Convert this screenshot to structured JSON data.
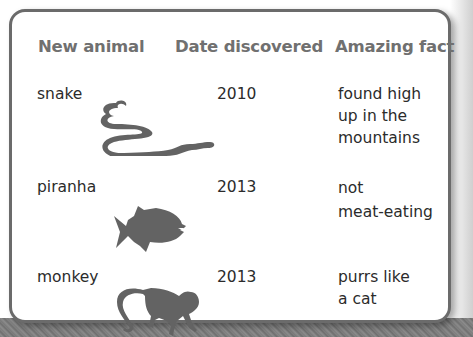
{
  "table": {
    "headers": {
      "animal": "New animal",
      "date": "Date discovered",
      "fact": "Amazing fact"
    },
    "rows": [
      {
        "animal": "snake",
        "icon": "snake-icon",
        "date": "2010",
        "fact_lines": [
          "found high",
          "up in the",
          "mountains"
        ]
      },
      {
        "animal": "piranha",
        "icon": "piranha-icon",
        "date": "2013",
        "fact_lines": [
          "not",
          "meat-eating"
        ]
      },
      {
        "animal": "monkey",
        "icon": "monkey-icon",
        "date": "2013",
        "fact_lines": [
          "purrs like",
          "a cat"
        ]
      }
    ]
  },
  "colors": {
    "header_text": "#707070",
    "body_text": "#2b2b2b",
    "border": "#6b6b6b",
    "silhouette": "#636363"
  }
}
